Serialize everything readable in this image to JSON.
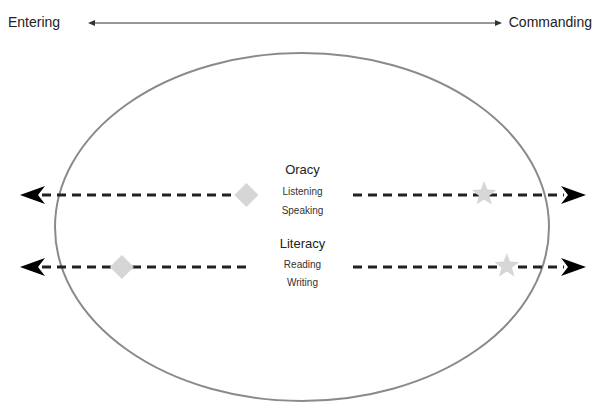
{
  "scale": {
    "left_label": "Entering",
    "right_label": "Commanding"
  },
  "continua": [
    {
      "category": "Oracy",
      "skills": [
        "Listening",
        "Speaking"
      ],
      "entry_marker": {
        "shape": "diamond",
        "position": 0.4
      },
      "goal_marker": {
        "shape": "star",
        "position": 0.82
      }
    },
    {
      "category": "Literacy",
      "skills": [
        "Reading",
        "Writing"
      ],
      "entry_marker": {
        "shape": "diamond",
        "position": 0.18
      },
      "goal_marker": {
        "shape": "star",
        "position": 0.86
      }
    }
  ],
  "colors": {
    "ellipse": "#8a8a8a",
    "dash": "#222222",
    "marker": "#d6d6d6",
    "arrow": "#000000"
  }
}
